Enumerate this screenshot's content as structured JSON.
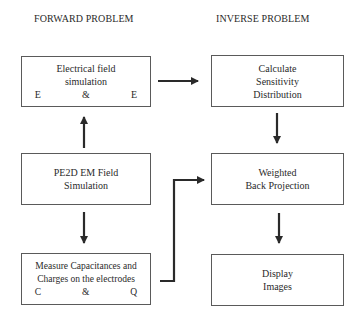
{
  "headers": {
    "forward": "FORWARD PROBLEM",
    "inverse": "INVERSE PROBLEM"
  },
  "boxes": {
    "electrical_field": {
      "line1": "Electrical field",
      "line2": "simulation",
      "symbols": [
        "E",
        "&",
        "E"
      ]
    },
    "pe2d": {
      "line1": "PE2D EM Field",
      "line2": "Simulation"
    },
    "measure": {
      "line1": "Measure Capacitances and",
      "line2": "Charges on the electrodes",
      "symbols": [
        "C",
        "&",
        "Q"
      ]
    },
    "sensitivity": {
      "line1": "Calculate",
      "line2": "Sensitivity",
      "line3": "Distribution"
    },
    "back_projection": {
      "line1": "Weighted",
      "line2": "Back Projection"
    },
    "display": {
      "line1": "Display",
      "line2": "Images"
    }
  },
  "colors": {
    "line": "#2a2a2a",
    "border": "#5a5a5a"
  }
}
